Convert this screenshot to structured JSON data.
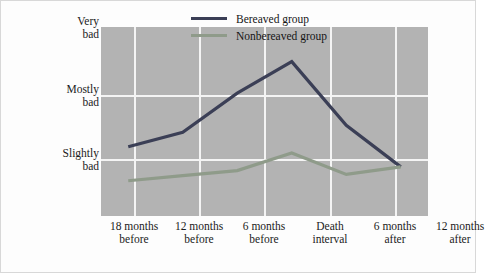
{
  "chart_data": {
    "type": "line",
    "title": "",
    "xlabel": "",
    "ylabel": "Average family stress",
    "categories": [
      "18 months before",
      "12 months before",
      "6 months before",
      "Death interval",
      "6 months after",
      "12 months after"
    ],
    "category_lines": [
      [
        "18 months",
        "before"
      ],
      [
        "12 months",
        "before"
      ],
      [
        "6 months",
        "before"
      ],
      [
        "Death",
        "interval"
      ],
      [
        "6 months",
        "after"
      ],
      [
        "12 months",
        "after"
      ]
    ],
    "y_tick_labels": [
      "Very bad",
      "Mostly bad",
      "Slightly bad"
    ],
    "y_tick_lines": [
      [
        "Very",
        "bad"
      ],
      [
        "Mostly",
        "bad"
      ],
      [
        "Slightly",
        "bad"
      ]
    ],
    "y_tick_values": [
      3,
      2,
      1
    ],
    "ylim": [
      0,
      3
    ],
    "grid": true,
    "legend_position": "top-right",
    "series": [
      {
        "name": "Bereaved group",
        "color": "#3b3f56",
        "values": [
          1.1,
          1.33,
          1.95,
          2.45,
          1.44,
          0.78
        ]
      },
      {
        "name": "Nonbereaved group",
        "color": "#8f9b8a",
        "values": [
          0.56,
          0.64,
          0.72,
          1.0,
          0.66,
          0.78
        ]
      }
    ]
  },
  "legend": {
    "items": [
      {
        "label": "Bereaved group",
        "color": "#3b3f56"
      },
      {
        "label": "Nonbereaved group",
        "color": "#8f9b8a"
      }
    ]
  },
  "colors": {
    "plot_background": "#b3b3b3",
    "gridline": "#f4f4f4",
    "figure_background": "#fdfdfd",
    "figure_border": "#d8d8d8",
    "text": "#1b1b1b"
  }
}
